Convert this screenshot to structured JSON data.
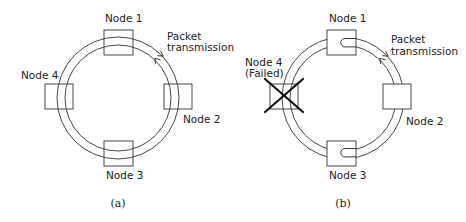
{
  "figure": {
    "panels": [
      {
        "id": "a",
        "caption": "(a)",
        "nodes": {
          "n1": "Node 1",
          "n2": "Node 2",
          "n3": "Node 3",
          "n4": "Node 4"
        },
        "annotation_line1": "Packet",
        "annotation_line2": "transmission"
      },
      {
        "id": "b",
        "caption": "(b)",
        "nodes": {
          "n1": "Node 1",
          "n2": "Node 2",
          "n3": "Node 3",
          "n4": "Node 4",
          "n4_status": "(Failed)"
        },
        "annotation_line1": "Packet",
        "annotation_line2": "transmission"
      }
    ],
    "colors": {
      "line": "#333333",
      "failed_cross": "#111111",
      "background": "#ffffff"
    }
  }
}
